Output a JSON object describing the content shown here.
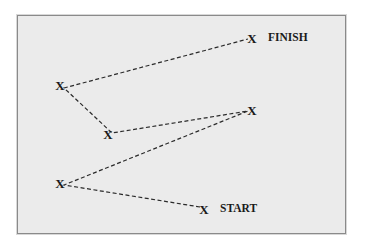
{
  "diagram": {
    "panel_color": "#ebebeb",
    "line_color": "#2a2a2a",
    "marker_glyph": "X",
    "points": [
      {
        "id": "start",
        "x": 204,
        "y": 209,
        "label": "START"
      },
      {
        "id": "p1",
        "x": 60,
        "y": 183,
        "label": ""
      },
      {
        "id": "p2",
        "x": 252,
        "y": 110,
        "label": ""
      },
      {
        "id": "p3",
        "x": 108,
        "y": 134,
        "label": ""
      },
      {
        "id": "p4",
        "x": 60,
        "y": 85,
        "label": ""
      },
      {
        "id": "finish",
        "x": 252,
        "y": 38,
        "label": "FINISH"
      }
    ],
    "labels": {
      "start": "START",
      "finish": "FINISH"
    }
  }
}
